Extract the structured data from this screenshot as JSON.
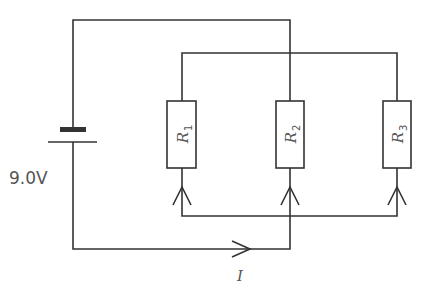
{
  "diagram": {
    "type": "circuit",
    "battery": {
      "label": "9.0V"
    },
    "resistors": [
      {
        "name": "R",
        "subscript": "1"
      },
      {
        "name": "R",
        "subscript": "2"
      },
      {
        "name": "R",
        "subscript": "3"
      }
    ],
    "current": {
      "label": "I"
    },
    "colors": {
      "line": "#333333",
      "text": "#555555",
      "background": "#ffffff"
    }
  }
}
